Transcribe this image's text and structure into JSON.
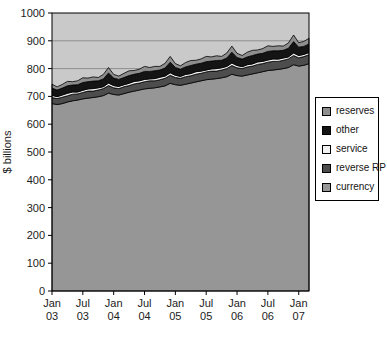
{
  "plot_style": {
    "plot_background": "#c9c9c9",
    "gridline_color": "#8f8f8f",
    "axis_color": "#000000",
    "series_outline": "#000000",
    "text_color": "#1c1c1c"
  },
  "chart_data": {
    "type": "area",
    "stacked": true,
    "title": "",
    "xlabel": "",
    "ylabel": "$ billions",
    "ylim": [
      0,
      1000
    ],
    "ytick_interval": 100,
    "grid": "horizontal",
    "legend_position": "right",
    "y_tick_labels": [
      "0",
      "100",
      "200",
      "300",
      "400",
      "500",
      "600",
      "700",
      "800",
      "900",
      "1000"
    ],
    "x_tick_labels": [
      {
        "line1": "Jan",
        "line2": "03"
      },
      {
        "line1": "Jul",
        "line2": "03"
      },
      {
        "line1": "Jan",
        "line2": "04"
      },
      {
        "line1": "Jul",
        "line2": "04"
      },
      {
        "line1": "Jan",
        "line2": "05"
      },
      {
        "line1": "Jul",
        "line2": "05"
      },
      {
        "line1": "Jan",
        "line2": "06"
      },
      {
        "line1": "Jul",
        "line2": "06"
      },
      {
        "line1": "Jan",
        "line2": "07"
      }
    ],
    "x_tick_months": [
      0,
      6,
      12,
      18,
      24,
      30,
      36,
      42,
      48
    ],
    "x_unit": "month (Jan 2003 - Mar 2007)",
    "series_stack_order_bottom_to_top": [
      "currency",
      "reverse RP",
      "service",
      "other",
      "reserves"
    ],
    "series": [
      {
        "name": "currency",
        "color": "#969696",
        "values": [
          674,
          671,
          674,
          680,
          684,
          687,
          691,
          694,
          696,
          699,
          703,
          712,
          707,
          705,
          710,
          715,
          719,
          723,
          727,
          729,
          731,
          734,
          738,
          747,
          742,
          740,
          744,
          748,
          752,
          756,
          760,
          762,
          764,
          767,
          771,
          780,
          775,
          773,
          777,
          781,
          785,
          789,
          793,
          795,
          797,
          800,
          804,
          814,
          809,
          812,
          818
        ]
      },
      {
        "name": "reverse RP",
        "color": "#4d4d4d",
        "values": [
          22,
          21,
          23,
          22,
          24,
          22,
          23,
          25,
          23,
          24,
          25,
          27,
          24,
          23,
          25,
          24,
          26,
          25,
          26,
          27,
          25,
          26,
          27,
          29,
          26,
          25,
          27,
          26,
          28,
          27,
          28,
          29,
          27,
          28,
          29,
          31,
          28,
          27,
          29,
          28,
          30,
          29,
          30,
          31,
          29,
          30,
          31,
          33,
          30,
          31,
          32
        ]
      },
      {
        "name": "service",
        "color": "#f2f2f2",
        "values": [
          8,
          7,
          8,
          9,
          8,
          7,
          8,
          8,
          9,
          8,
          7,
          9,
          8,
          8,
          7,
          8,
          9,
          8,
          8,
          7,
          8,
          9,
          8,
          9,
          8,
          7,
          8,
          8,
          9,
          8,
          7,
          8,
          9,
          8,
          8,
          9,
          8,
          7,
          8,
          8,
          9,
          8,
          8,
          9,
          8,
          8,
          7,
          9,
          8,
          8,
          8
        ]
      },
      {
        "name": "other",
        "color": "#141414",
        "values": [
          26,
          24,
          25,
          27,
          25,
          26,
          28,
          26,
          27,
          25,
          28,
          36,
          27,
          25,
          26,
          28,
          26,
          27,
          29,
          27,
          28,
          26,
          29,
          38,
          28,
          26,
          27,
          29,
          27,
          28,
          30,
          28,
          29,
          27,
          30,
          39,
          29,
          27,
          28,
          30,
          28,
          29,
          31,
          29,
          30,
          28,
          31,
          41,
          30,
          29,
          31
        ]
      },
      {
        "name": "reserves",
        "color": "#8e8e8e",
        "values": [
          14,
          11,
          13,
          16,
          12,
          14,
          17,
          13,
          15,
          12,
          16,
          20,
          13,
          12,
          15,
          17,
          13,
          15,
          18,
          14,
          16,
          13,
          17,
          21,
          14,
          12,
          16,
          18,
          14,
          16,
          19,
          15,
          17,
          14,
          18,
          22,
          15,
          13,
          17,
          19,
          15,
          17,
          20,
          16,
          18,
          15,
          19,
          24,
          16,
          18,
          20
        ]
      }
    ],
    "legend_entries": [
      {
        "key": "reserves",
        "label": "reserves",
        "color": "#8e8e8e"
      },
      {
        "key": "other",
        "label": "other",
        "color": "#141414"
      },
      {
        "key": "service",
        "label": "service",
        "color": "#f2f2f2"
      },
      {
        "key": "reverse-rp",
        "label": "reverse RP",
        "color": "#4d4d4d"
      },
      {
        "key": "currency",
        "label": "currency",
        "color": "#969696"
      }
    ]
  }
}
